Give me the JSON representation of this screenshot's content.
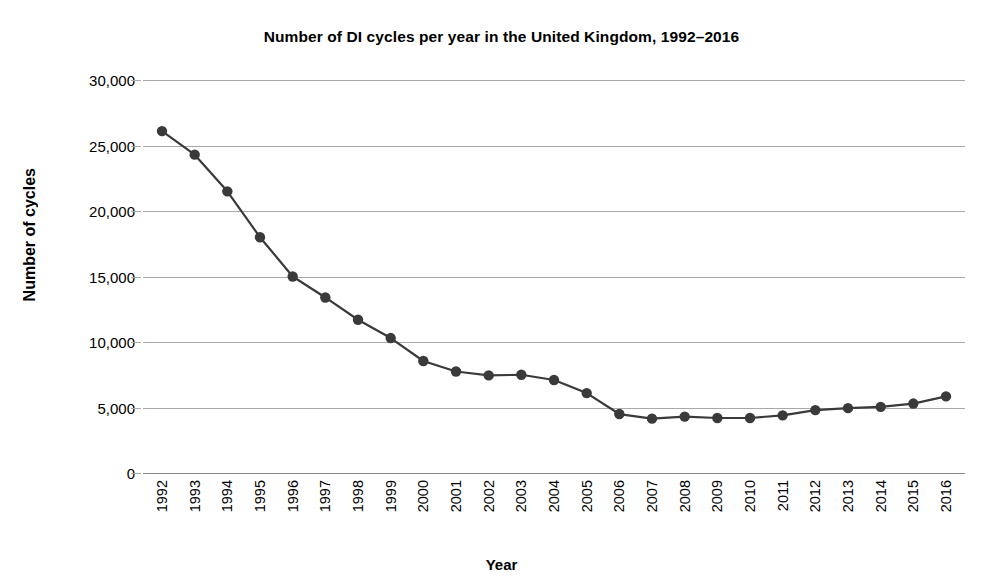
{
  "chart_data": {
    "type": "line",
    "title": "Number of DI cycles per year in the United Kingdom, 1992–2016",
    "xlabel": "Year",
    "ylabel": "Number of cycles",
    "categories": [
      "1992",
      "1993",
      "1994",
      "1995",
      "1996",
      "1997",
      "1998",
      "1999",
      "2000",
      "2001",
      "2002",
      "2003",
      "2004",
      "2005",
      "2006",
      "2007",
      "2008",
      "2009",
      "2010",
      "2011",
      "2012",
      "2013",
      "2014",
      "2015",
      "2016"
    ],
    "values": [
      26100,
      24300,
      21500,
      18000,
      15000,
      13400,
      11700,
      10300,
      8550,
      7750,
      7450,
      7500,
      7100,
      6100,
      4500,
      4150,
      4300,
      4200,
      4200,
      4400,
      4800,
      4950,
      5050,
      5300,
      5850
    ],
    "series": [
      {
        "name": "DI cycles",
        "values": [
          26100,
          24300,
          21500,
          18000,
          15000,
          13400,
          11700,
          10300,
          8550,
          7750,
          7450,
          7500,
          7100,
          6100,
          4500,
          4150,
          4300,
          4200,
          4200,
          4400,
          4800,
          4950,
          5050,
          5300,
          5850
        ]
      }
    ],
    "ylim": [
      0,
      30000
    ],
    "yticks": [
      0,
      5000,
      10000,
      15000,
      20000,
      25000,
      30000
    ],
    "ytick_labels": [
      "0",
      "5,000",
      "10,000",
      "15,000",
      "20,000",
      "25,000",
      "30,000"
    ],
    "grid": true,
    "legend": "none",
    "line_color": "#3a3a3a",
    "marker_color": "#3a3a3a",
    "grid_color": "#a9a9a9",
    "background": "#ffffff"
  }
}
